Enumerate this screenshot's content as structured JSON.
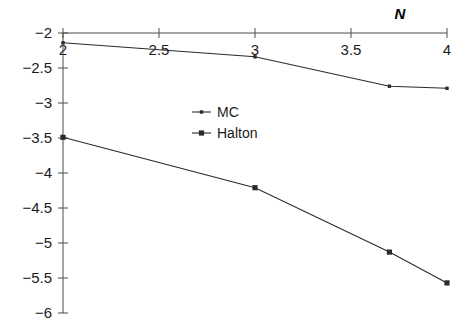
{
  "chart_data": {
    "type": "line",
    "title": "",
    "subtitle": "",
    "xlabel": "N",
    "ylabel": "",
    "xlim": [
      2,
      4
    ],
    "ylim": [
      -6,
      -2
    ],
    "grid": false,
    "legend_position": "center-left-inside",
    "x_ticks": [
      "2",
      "2.5",
      "3",
      "3.5",
      "4"
    ],
    "x_tick_values": [
      2,
      2.5,
      3,
      3.5,
      4
    ],
    "y_ticks": [
      "-2",
      "-2.5",
      "-3",
      "-3.5",
      "-4",
      "-4.5",
      "-5",
      "-5.5",
      "-6"
    ],
    "y_tick_values": [
      -2,
      -2.5,
      -3,
      -3.5,
      -4,
      -4.5,
      -5,
      -5.5,
      -6
    ],
    "x_axis_position": "top",
    "series": [
      {
        "name": "MC",
        "marker": "dot",
        "color": "#2b2b2b",
        "x": [
          2,
          3,
          3.7,
          4
        ],
        "values": [
          -2.14,
          -2.34,
          -2.76,
          -2.79
        ]
      },
      {
        "name": "Halton",
        "marker": "square",
        "color": "#2b2b2b",
        "x": [
          2,
          3,
          3.7,
          4
        ],
        "values": [
          -3.49,
          -4.21,
          -5.13,
          -5.57
        ]
      }
    ]
  },
  "axis": {
    "x_title": "N"
  },
  "legend": {
    "entries": [
      {
        "label": "MC"
      },
      {
        "label": "Halton"
      }
    ]
  }
}
